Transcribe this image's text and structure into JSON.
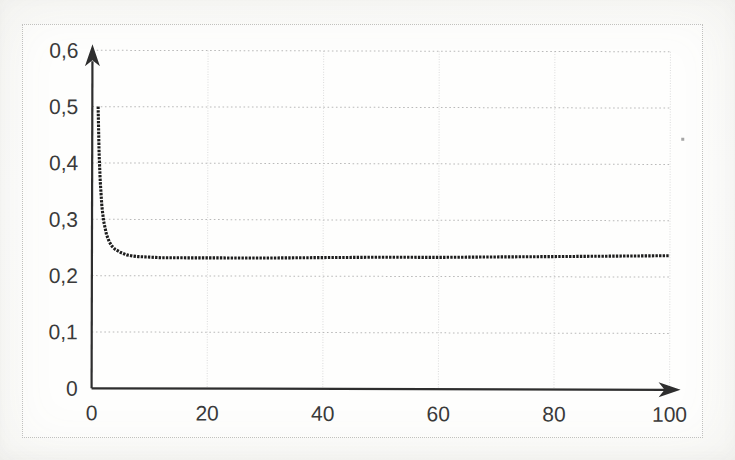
{
  "figure": {
    "background": "#fefefd",
    "border_color": "#c3c3c1",
    "paper_color": "#fcfcfa"
  },
  "chart_data": {
    "type": "line",
    "title": "",
    "xlabel": "",
    "ylabel": "",
    "xlim": [
      0,
      100
    ],
    "ylim": [
      0,
      0.6
    ],
    "grid": true,
    "legend": "none",
    "decimal_separator": ",",
    "axis_arrows": true,
    "x_ticks": [
      0,
      20,
      40,
      60,
      80,
      100
    ],
    "x_tick_labels": [
      "0",
      "20",
      "40",
      "60",
      "80",
      "100"
    ],
    "y_ticks": [
      0,
      0.1,
      0.2,
      0.3,
      0.4,
      0.5,
      0.6
    ],
    "y_tick_labels": [
      "0",
      "0,1",
      "0,2",
      "0,3",
      "0,4",
      "0,5",
      "0,6"
    ],
    "colors": {
      "curve": "#1d1d1d",
      "axis": "#2e2e2e",
      "grid_horizontal": "#b9b9b9",
      "grid_vertical": "#dedede",
      "tick_text": "#3a3a3a"
    },
    "series": [
      {
        "name": "curve",
        "style": "dense-dotted",
        "points": [
          [
            1,
            0.5
          ],
          [
            1.2,
            0.417
          ],
          [
            1.4,
            0.368
          ],
          [
            1.7,
            0.323
          ],
          [
            2,
            0.297
          ],
          [
            2.5,
            0.273
          ],
          [
            3,
            0.26
          ],
          [
            3.5,
            0.252
          ],
          [
            4,
            0.247
          ],
          [
            5,
            0.241
          ],
          [
            6,
            0.237
          ],
          [
            7,
            0.235
          ],
          [
            8,
            0.234
          ],
          [
            10,
            0.233
          ],
          [
            12,
            0.232
          ],
          [
            15,
            0.232
          ],
          [
            20,
            0.232
          ],
          [
            25,
            0.232
          ],
          [
            30,
            0.232
          ],
          [
            40,
            0.233
          ],
          [
            50,
            0.234
          ],
          [
            60,
            0.234
          ],
          [
            70,
            0.235
          ],
          [
            80,
            0.236
          ],
          [
            90,
            0.237
          ],
          [
            100,
            0.238
          ]
        ]
      }
    ],
    "annotations": [
      {
        "name": "dust-speck",
        "x_px": 681,
        "y_px": 137
      }
    ]
  }
}
